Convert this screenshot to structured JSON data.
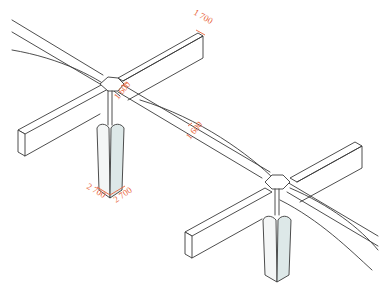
{
  "diagram": {
    "type": "isometric structural drawing",
    "colors": {
      "linework": "#3a3a3a",
      "dimension": "#e8633a",
      "post_shade": "#dde8e8",
      "background": "#ffffff"
    },
    "dimensions": [
      {
        "id": "beam-end-width",
        "label": "1 700"
      },
      {
        "id": "node1-beam-width",
        "label": "1 600"
      },
      {
        "id": "mid-beam-width",
        "label": "1 600"
      },
      {
        "id": "post-base-left",
        "label": "2 700"
      },
      {
        "id": "post-base-right",
        "label": "2 700"
      }
    ]
  }
}
